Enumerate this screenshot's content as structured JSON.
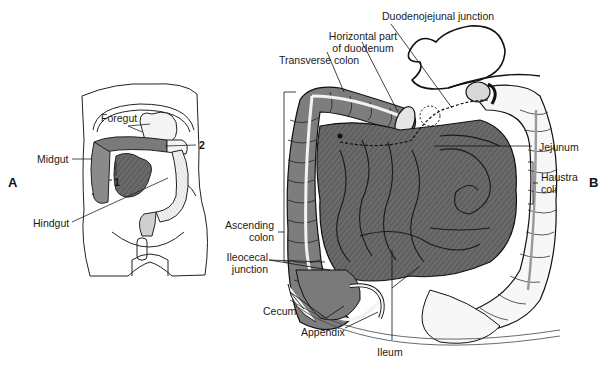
{
  "figure": {
    "panels": {
      "a": "A",
      "b": "B"
    },
    "panel_a": {
      "labels": {
        "foregut": "Foregut",
        "midgut": "Midgut",
        "hindgut": "Hindgut",
        "marker_1": "1",
        "marker_2": "2"
      }
    },
    "panel_b": {
      "labels": {
        "duodenojejunal_junction": "Duodenojejunal junction",
        "horizontal_part_line1": "Horizontal part",
        "horizontal_part_line2": "of duodenum",
        "transverse_colon": "Transverse colon",
        "jejunum": "Jejunum",
        "haustra_line1": "Haustra",
        "haustra_line2": "coli",
        "ascending_line1": "Ascending",
        "ascending_line2": "colon",
        "ileocecal_line1": "Ileocecal",
        "ileocecal_line2": "junction",
        "cecum": "Cecum",
        "appendix": "Appendix",
        "ileum": "Ileum"
      }
    },
    "colors": {
      "small_intestine": "#6e6e6e",
      "midgut_colon": "#8a8a8a",
      "hindgut_colon": "#f4f4f4",
      "outline": "#1a1a1a"
    }
  }
}
